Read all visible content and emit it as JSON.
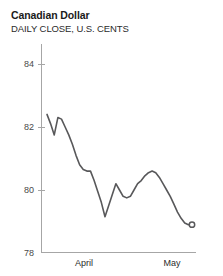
{
  "header": {
    "title": "Canadian Dollar",
    "subtitle": "DAILY CLOSE, U.S. CENTS"
  },
  "colors": {
    "line": "#58585a",
    "axis": "#a6a6a6",
    "tick_text": "#4a4a4a",
    "title_text": "#1a1a1a",
    "background": "#ffffff"
  },
  "chart_data": {
    "type": "line",
    "title": "Canadian Dollar",
    "subtitle": "DAILY CLOSE, U.S. CENTS",
    "xlabel": "",
    "ylabel": "",
    "ylim": [
      78,
      85
    ],
    "yticks": [
      78,
      80,
      82,
      84
    ],
    "ytick_labels": [
      "78",
      "80",
      "82",
      "84"
    ],
    "xticks": [
      11,
      33
    ],
    "xtick_labels": [
      "April",
      "May"
    ],
    "grid": false,
    "legend": null,
    "marker_last_point": "open-circle",
    "x": [
      0,
      1,
      2,
      3,
      4,
      5,
      6,
      7,
      8,
      9,
      10,
      11,
      12,
      13,
      14,
      15,
      16,
      17,
      18,
      19,
      20,
      21,
      22,
      23,
      24,
      25,
      26,
      27,
      28,
      29,
      30,
      31,
      32,
      33,
      34,
      35,
      36,
      37,
      38,
      39,
      40
    ],
    "values": [
      82.4,
      82.1,
      81.75,
      82.3,
      82.25,
      82.0,
      81.75,
      81.45,
      81.1,
      80.8,
      80.65,
      80.6,
      80.6,
      80.3,
      79.95,
      79.6,
      79.15,
      79.5,
      79.85,
      80.2,
      80.0,
      79.8,
      79.75,
      79.8,
      80.0,
      80.2,
      80.3,
      80.45,
      80.55,
      80.6,
      80.55,
      80.4,
      80.2,
      80.0,
      79.8,
      79.55,
      79.3,
      79.1,
      78.95,
      78.9,
      78.9
    ],
    "last_value": 78.9
  }
}
